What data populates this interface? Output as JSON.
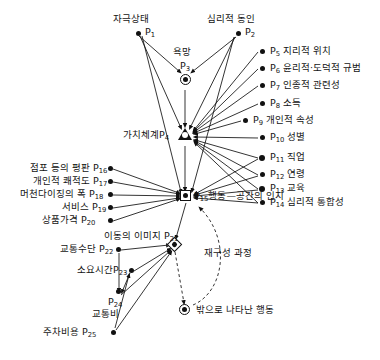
{
  "diagram": {
    "type": "node-link-diagram",
    "stroke_color": "#111111",
    "background": "#ffffff",
    "nodes": [
      {
        "id": "P1",
        "label": "자극상태",
        "code": "P",
        "sub": "1",
        "shape": "dot",
        "x": 138,
        "y": 32,
        "label_pos": "above"
      },
      {
        "id": "P2",
        "label": "심리적 동인",
        "code": "P",
        "sub": "2",
        "shape": "dot",
        "x": 238,
        "y": 32,
        "label_pos": "above"
      },
      {
        "id": "P3",
        "label": "욕망",
        "code": "P",
        "sub": "3",
        "shape": "bullseye",
        "x": 185,
        "y": 79,
        "label_pos": "above"
      },
      {
        "id": "P4",
        "label": "가치체계",
        "code": "P",
        "sub": "4",
        "shape": "triangle",
        "x": 184,
        "y": 136,
        "label_pos": "left"
      },
      {
        "id": "P5",
        "label": "지리적 위치",
        "code": "P",
        "sub": "5",
        "shape": "dot",
        "x": 262,
        "y": 51,
        "label_pos": "right"
      },
      {
        "id": "P6",
        "label": "윤리적·도덕적 규범",
        "code": "P",
        "sub": "6",
        "shape": "dot",
        "x": 262,
        "y": 68,
        "label_pos": "right"
      },
      {
        "id": "P7",
        "label": "인종적 관련성",
        "code": "P",
        "sub": "7",
        "shape": "dot",
        "x": 262,
        "y": 85,
        "label_pos": "right"
      },
      {
        "id": "P8",
        "label": "소득",
        "code": "P",
        "sub": "8",
        "shape": "dot",
        "x": 262,
        "y": 103,
        "label_pos": "right"
      },
      {
        "id": "P9",
        "label": "개인적 속성",
        "code": "P",
        "sub": "9",
        "shape": "dot",
        "x": 245,
        "y": 120,
        "label_pos": "right"
      },
      {
        "id": "P10",
        "label": "성별",
        "code": "P",
        "sub": "10",
        "shape": "dot",
        "x": 262,
        "y": 137,
        "label_pos": "right"
      },
      {
        "id": "P11",
        "label": "직업",
        "code": "P",
        "sub": "11",
        "shape": "dot",
        "x": 262,
        "y": 157,
        "label_pos": "right"
      },
      {
        "id": "P12",
        "label": "연령",
        "code": "P",
        "sub": "12",
        "shape": "dot",
        "x": 262,
        "y": 174,
        "label_pos": "right"
      },
      {
        "id": "P13",
        "label": "교육",
        "code": "P",
        "sub": "13",
        "shape": "dot",
        "x": 262,
        "y": 188,
        "label_pos": "right"
      },
      {
        "id": "P14",
        "label": "심리적 통합성",
        "code": "P",
        "sub": "14",
        "shape": "dot",
        "x": 262,
        "y": 202,
        "label_pos": "right"
      },
      {
        "id": "P15",
        "label": "행동—공간의 인지",
        "code": "P",
        "sub": "15",
        "shape": "square",
        "x": 186,
        "y": 196,
        "label_pos": "right"
      },
      {
        "id": "P16",
        "label": "점포 등의 평판",
        "code": "P",
        "sub": "16",
        "shape": "dot",
        "x": 110,
        "y": 168,
        "label_pos": "left"
      },
      {
        "id": "P17",
        "label": "개인적 쾌적도",
        "code": "P",
        "sub": "17",
        "shape": "dot",
        "x": 110,
        "y": 181,
        "label_pos": "left"
      },
      {
        "id": "P18",
        "label": "머천다이징의 폭",
        "code": "P",
        "sub": "18",
        "shape": "dot",
        "x": 110,
        "y": 194,
        "label_pos": "left"
      },
      {
        "id": "P19",
        "label": "서비스",
        "code": "P",
        "sub": "19",
        "shape": "dot",
        "x": 110,
        "y": 207,
        "label_pos": "left"
      },
      {
        "id": "P20",
        "label": "상품가격",
        "code": "P",
        "sub": "20",
        "shape": "dot",
        "x": 110,
        "y": 220,
        "label_pos": "left"
      },
      {
        "id": "P21",
        "label": "이동의 이미지",
        "code": "P",
        "sub": "21",
        "shape": "diamond",
        "x": 175,
        "y": 245,
        "label_pos": "above-left"
      },
      {
        "id": "P22",
        "label": "교통수단",
        "code": "P",
        "sub": "22",
        "shape": "dot",
        "x": 118,
        "y": 249,
        "label_pos": "left"
      },
      {
        "id": "P23",
        "label": "소요시간",
        "code": "P",
        "sub": "23",
        "shape": "dot",
        "x": 131,
        "y": 270,
        "label_pos": "left"
      },
      {
        "id": "P24",
        "label": "교통비",
        "code": "P",
        "sub": "24",
        "shape": "dot",
        "x": 118,
        "y": 296,
        "label_pos": "below"
      },
      {
        "id": "P25",
        "label": "주차비용",
        "code": "P",
        "sub": "25",
        "shape": "dot",
        "x": 113,
        "y": 332,
        "label_pos": "left"
      },
      {
        "id": "OUT",
        "label": "밖으로 나타난 행동",
        "code": "",
        "sub": "",
        "shape": "bullseye",
        "x": 185,
        "y": 310,
        "label_pos": "right"
      }
    ],
    "annotations": [
      {
        "id": "feedback",
        "text": "재구성 과정",
        "x": 232,
        "y": 252,
        "style": "dashed-loop-label"
      }
    ],
    "edges": [
      {
        "from": "P1",
        "to": "P3",
        "style": "solid"
      },
      {
        "from": "P1",
        "to": "P4",
        "style": "solid"
      },
      {
        "from": "P1",
        "to": "P15",
        "style": "solid"
      },
      {
        "from": "P2",
        "to": "P3",
        "style": "solid"
      },
      {
        "from": "P2",
        "to": "P4",
        "style": "solid"
      },
      {
        "from": "P2",
        "to": "P15",
        "style": "solid"
      },
      {
        "from": "P3",
        "to": "P4",
        "style": "solid"
      },
      {
        "from": "P4",
        "to": "P15",
        "style": "solid"
      },
      {
        "from": "P5",
        "to": "P4",
        "style": "solid"
      },
      {
        "from": "P6",
        "to": "P4",
        "style": "solid"
      },
      {
        "from": "P7",
        "to": "P4",
        "style": "solid"
      },
      {
        "from": "P8",
        "to": "P4",
        "style": "solid"
      },
      {
        "from": "P9",
        "to": "P4",
        "style": "solid"
      },
      {
        "from": "P10",
        "to": "P4",
        "style": "solid"
      },
      {
        "from": "P11",
        "to": "P4",
        "style": "solid"
      },
      {
        "from": "P12",
        "to": "P4",
        "style": "solid"
      },
      {
        "from": "P13",
        "to": "P4",
        "style": "solid"
      },
      {
        "from": "P14",
        "to": "P4",
        "style": "solid"
      },
      {
        "from": "P11",
        "to": "P15",
        "style": "solid"
      },
      {
        "from": "P12",
        "to": "P15",
        "style": "solid"
      },
      {
        "from": "P13",
        "to": "P15",
        "style": "solid"
      },
      {
        "from": "P14",
        "to": "P15",
        "style": "solid"
      },
      {
        "from": "P16",
        "to": "P15",
        "style": "solid"
      },
      {
        "from": "P17",
        "to": "P15",
        "style": "solid"
      },
      {
        "from": "P18",
        "to": "P15",
        "style": "solid"
      },
      {
        "from": "P19",
        "to": "P15",
        "style": "solid"
      },
      {
        "from": "P20",
        "to": "P15",
        "style": "solid"
      },
      {
        "from": "P15",
        "to": "P21",
        "style": "solid"
      },
      {
        "from": "P22",
        "to": "P21",
        "style": "solid"
      },
      {
        "from": "P23",
        "to": "P21",
        "style": "solid"
      },
      {
        "from": "P24",
        "to": "P21",
        "style": "solid"
      },
      {
        "from": "P25",
        "to": "P21",
        "style": "solid"
      },
      {
        "from": "P22",
        "to": "P24",
        "style": "solid"
      },
      {
        "from": "P23",
        "to": "P24",
        "style": "solid"
      },
      {
        "from": "P25",
        "to": "P23",
        "style": "solid"
      },
      {
        "from": "P21",
        "to": "OUT",
        "style": "dashed"
      },
      {
        "from": "OUT",
        "to": "P15",
        "style": "dashed"
      }
    ]
  }
}
